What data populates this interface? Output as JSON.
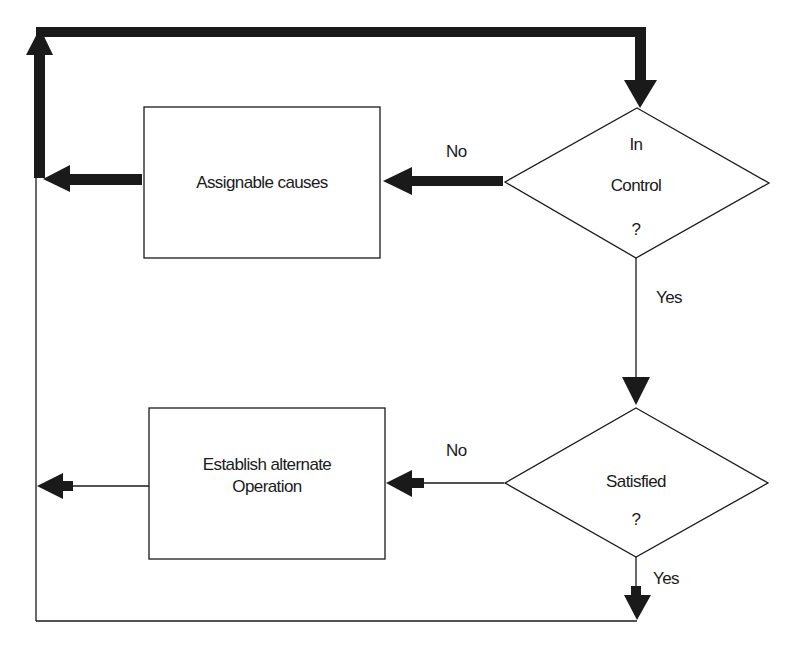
{
  "diagram": {
    "type": "flowchart",
    "nodes": {
      "in_control": {
        "shape": "diamond",
        "line1": "In",
        "line2": "Control",
        "line3": "?"
      },
      "assignable_causes": {
        "shape": "rectangle",
        "label": "Assignable causes"
      },
      "satisfied": {
        "shape": "diamond",
        "line1": "Satisfied",
        "line2": "?"
      },
      "establish_alternate": {
        "shape": "rectangle",
        "line1": "Establish alternate",
        "line2": "Operation"
      }
    },
    "edges": {
      "in_control_no": "No",
      "in_control_yes": "Yes",
      "satisfied_no": "No",
      "satisfied_yes": "Yes"
    },
    "colors": {
      "stroke": "#1a1a1a",
      "background": "#ffffff"
    }
  }
}
